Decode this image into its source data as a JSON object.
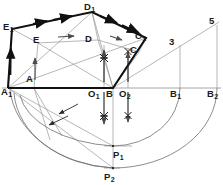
{
  "figure": {
    "background_color": "#ffffff",
    "stroke_thin_color": "#8c8c8c",
    "stroke_bold_color": "#111111",
    "arc_color": "#6f6f6f",
    "baseline_y": 88
  },
  "labels": [
    {
      "name": "label-E1",
      "base": "E",
      "sub": "1",
      "x": 3,
      "y": 22
    },
    {
      "name": "label-E",
      "base": "E",
      "sub": "",
      "x": 33,
      "y": 35
    },
    {
      "name": "label-D1",
      "base": "D",
      "sub": "1",
      "x": 84,
      "y": 2
    },
    {
      "name": "label-D",
      "base": "D",
      "sub": "",
      "x": 85,
      "y": 34
    },
    {
      "name": "label-C1",
      "base": "C",
      "sub": "1",
      "x": 135,
      "y": 31
    },
    {
      "name": "label-C",
      "base": "C",
      "sub": "",
      "x": 130,
      "y": 45
    },
    {
      "name": "label-A",
      "base": "A",
      "sub": "",
      "x": 26,
      "y": 74
    },
    {
      "name": "label-A1",
      "base": "A",
      "sub": "1",
      "x": 1,
      "y": 87
    },
    {
      "name": "label-O1",
      "base": "O",
      "sub": "1",
      "x": 88,
      "y": 89
    },
    {
      "name": "label-B",
      "base": "B",
      "sub": "",
      "x": 106,
      "y": 89
    },
    {
      "name": "label-O2",
      "base": "O",
      "sub": "2",
      "x": 119,
      "y": 89
    },
    {
      "name": "label-B1",
      "base": "B",
      "sub": "1",
      "x": 170,
      "y": 89
    },
    {
      "name": "label-B2",
      "base": "B",
      "sub": "2",
      "x": 207,
      "y": 89
    },
    {
      "name": "label-P1",
      "base": "P",
      "sub": "1",
      "x": 113,
      "y": 150
    },
    {
      "name": "label-P2",
      "base": "P",
      "sub": "2",
      "x": 104,
      "y": 172
    }
  ],
  "numeric_labels": [
    {
      "name": "division-mark-3",
      "text": "3",
      "x": 169,
      "y": 37
    },
    {
      "name": "division-mark-5",
      "text": "5",
      "x": 209,
      "y": 16
    }
  ],
  "geometry": {
    "points": {
      "A1": [
        8,
        88
      ],
      "E1": [
        12,
        29
      ],
      "D1": [
        92,
        12
      ],
      "C1": [
        146,
        38
      ],
      "B": [
        113,
        88
      ],
      "A": [
        34,
        88
      ],
      "E": [
        38,
        43
      ],
      "D": [
        98,
        40
      ],
      "C": [
        139,
        52
      ],
      "O1": [
        104,
        88
      ],
      "O2": [
        128,
        88
      ],
      "B1": [
        180,
        88
      ],
      "B2": [
        217,
        88
      ],
      "P1": [
        113,
        146
      ],
      "P2": [
        113,
        168
      ],
      "M3": [
        180,
        45
      ],
      "M5": [
        217,
        25
      ]
    },
    "bold_outline": [
      "A1",
      "E1",
      "D1",
      "C1",
      "B"
    ],
    "thin_inner": [
      "A",
      "E",
      "D",
      "C",
      "B"
    ],
    "baseline": {
      "from": [
        2,
        88
      ],
      "to": [
        221,
        88
      ]
    },
    "arcs_note": "radius arcs swung about B down to baseline extensions and to P1/P2"
  }
}
